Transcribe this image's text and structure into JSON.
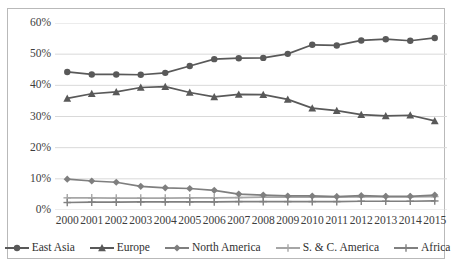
{
  "chart_data": {
    "type": "line",
    "title": "",
    "subtitle": "",
    "xlabel": "",
    "ylabel": "",
    "x": [
      2000,
      2001,
      2002,
      2003,
      2004,
      2005,
      2006,
      2007,
      2008,
      2009,
      2010,
      2011,
      2012,
      2013,
      2014,
      2015
    ],
    "categories": [
      "2000",
      "2001",
      "2002",
      "2003",
      "2004",
      "2005",
      "2006",
      "2007",
      "2008",
      "2009",
      "2010",
      "2011",
      "2012",
      "2013",
      "2014",
      "2015"
    ],
    "ylim": [
      0,
      60
    ],
    "ytick_values": [
      0,
      10,
      20,
      30,
      40,
      50,
      60
    ],
    "ytick_labels": [
      "0%",
      "10%",
      "20%",
      "30%",
      "40%",
      "50%",
      "60%"
    ],
    "y_unit": "%",
    "grid": true,
    "grid_axis": "y",
    "legend_position": "bottom",
    "series": [
      {
        "name": "East Asia",
        "marker": "circle",
        "color": "#595959",
        "values": [
          44.3,
          43.5,
          43.5,
          43.4,
          44.0,
          46.2,
          48.4,
          48.7,
          48.8,
          50.1,
          53.0,
          52.8,
          54.4,
          54.8,
          54.3,
          55.2
        ]
      },
      {
        "name": "Europe",
        "marker": "triangle",
        "color": "#595959",
        "values": [
          35.8,
          37.3,
          37.9,
          39.3,
          39.6,
          37.7,
          36.3,
          37.1,
          37.0,
          35.5,
          32.7,
          31.9,
          30.6,
          30.2,
          30.4,
          28.6
        ]
      },
      {
        "name": "North America",
        "marker": "diamond",
        "color": "#7f7f7f",
        "values": [
          9.9,
          9.3,
          8.9,
          7.6,
          7.1,
          6.9,
          6.3,
          5.1,
          4.8,
          4.5,
          4.5,
          4.3,
          4.6,
          4.4,
          4.4,
          4.8
        ]
      },
      {
        "name": "S. & C. America",
        "marker": "cross",
        "color": "#a6a6a6",
        "values": [
          3.9,
          3.9,
          3.8,
          3.8,
          3.8,
          3.9,
          3.9,
          4.0,
          4.1,
          4.1,
          4.1,
          4.1,
          4.2,
          4.2,
          4.2,
          4.3
        ]
      },
      {
        "name": "Africa",
        "marker": "plus",
        "color": "#808080",
        "values": [
          2.4,
          2.5,
          2.5,
          2.6,
          2.6,
          2.6,
          2.6,
          2.7,
          2.7,
          2.7,
          2.7,
          2.7,
          2.8,
          2.8,
          2.8,
          2.9
        ]
      }
    ]
  },
  "style": {
    "grid_color": "#d9d9d9",
    "border_color": "#b9b9b9",
    "text_color": "#3d3d3d",
    "background": "#ffffff"
  }
}
